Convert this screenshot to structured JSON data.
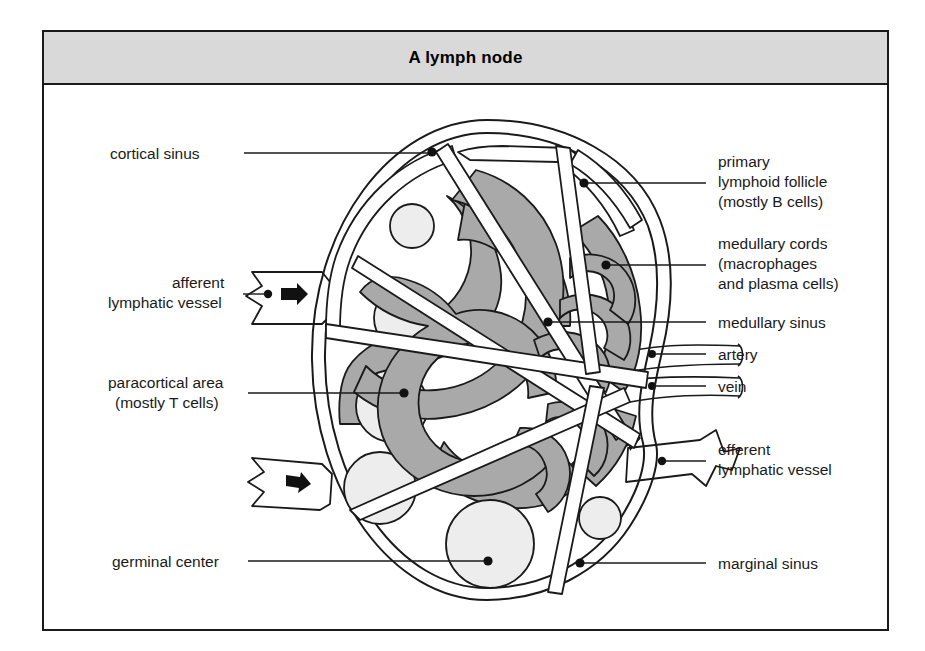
{
  "figure": {
    "title": "A lymph node",
    "background": "#ffffff",
    "title_bar_color": "#d9d9d9",
    "border_color": "#1a1a1a",
    "cord_color": "#a9a9a9",
    "germinal_center_color": "#ededed",
    "sinus_color": "#ffffff"
  },
  "labels": {
    "cortical_sinus": "cortical sinus",
    "afferent_line1": "afferent",
    "afferent_line2": "lymphatic vessel",
    "paracortical_line1": "paracortical area",
    "paracortical_line2": "(mostly T cells)",
    "germinal_center": "germinal center",
    "primary_line1": "primary",
    "primary_line2": "lymphoid follicle",
    "primary_line3": "(mostly B cells)",
    "medullary_cords_line1": "medullary cords",
    "medullary_cords_line2": "(macrophages",
    "medullary_cords_line3": "and plasma cells)",
    "medullary_sinus": "medullary sinus",
    "artery": "artery",
    "vein": "vein",
    "efferent_line1": "efferent",
    "efferent_line2": "lymphatic vessel",
    "marginal_sinus": "marginal sinus"
  }
}
